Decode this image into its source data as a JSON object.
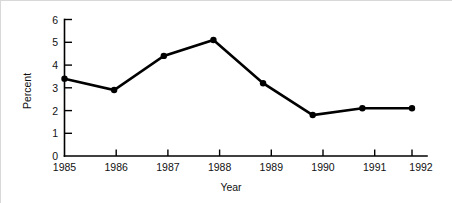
{
  "chart_data": {
    "type": "line",
    "title": "",
    "xlabel": "Year",
    "ylabel": "Percent",
    "categories": [
      "1985",
      "1986",
      "1987",
      "1988",
      "1989",
      "1990",
      "1991",
      "1992"
    ],
    "x": [
      1985,
      1986,
      1987,
      1988,
      1989,
      1990,
      1991,
      1992
    ],
    "values": [
      3.4,
      2.9,
      4.4,
      5.1,
      3.2,
      1.8,
      2.1,
      2.1
    ],
    "series": [
      {
        "name": "Percent",
        "values": [
          3.4,
          2.9,
          4.4,
          5.1,
          3.2,
          1.8,
          2.1,
          2.1
        ]
      }
    ],
    "ylim": [
      0,
      6
    ],
    "yticks": [
      0,
      1,
      2,
      3,
      4,
      5,
      6
    ],
    "ytick_labels": [
      "0",
      "1",
      "2",
      "3",
      "4",
      "5",
      "6"
    ],
    "xlim": [
      1985,
      1992
    ],
    "xtick_labels": [
      "1985",
      "1986",
      "1987",
      "1988",
      "1989",
      "1990",
      "1991",
      "1992"
    ],
    "grid": false,
    "legend": false,
    "marker": "filled-circle",
    "line_color": "#000000",
    "marker_color": "#000000",
    "background_color": "#ffffff"
  },
  "axes": {
    "y_title": "Percent",
    "x_title": "Year",
    "y_tick_0": "0",
    "y_tick_1": "1",
    "y_tick_2": "2",
    "y_tick_3": "3",
    "y_tick_4": "4",
    "y_tick_5": "5",
    "y_tick_6": "6",
    "x_tick_0": "1985",
    "x_tick_1": "1986",
    "x_tick_2": "1987",
    "x_tick_3": "1988",
    "x_tick_4": "1989",
    "x_tick_5": "1990",
    "x_tick_6": "1991",
    "x_tick_7": "1992"
  }
}
